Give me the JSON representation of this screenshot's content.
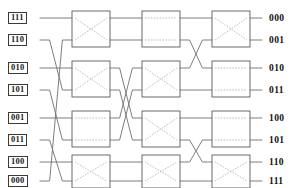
{
  "diagram": {
    "type": "benes-switching-network",
    "colors": {
      "wire": "#6f6f6f",
      "box_border": "#5a5a5a",
      "cross_line": "#a8a8a8",
      "label_text": "#111111",
      "label_border": "#3a3a3a",
      "background": "#ffffff"
    },
    "geometry": {
      "width": 307,
      "height": 188,
      "line_ys": [
        18,
        40,
        68,
        90,
        118,
        140,
        162,
        181
      ],
      "stage_x": [
        72,
        142,
        212
      ],
      "box_w": 38,
      "input_wire_x": 40,
      "output_wire_x": 262
    },
    "inputs": [
      {
        "label": "111",
        "y": 18
      },
      {
        "label": "110",
        "y": 40
      },
      {
        "label": "010",
        "y": 68
      },
      {
        "label": "101",
        "y": 90
      },
      {
        "label": "001",
        "y": 118
      },
      {
        "label": "011",
        "y": 140
      },
      {
        "label": "100",
        "y": 162
      },
      {
        "label": "000",
        "y": 181
      }
    ],
    "outputs": [
      {
        "label": "000",
        "y": 18
      },
      {
        "label": "001",
        "y": 40
      },
      {
        "label": "010",
        "y": 68
      },
      {
        "label": "011",
        "y": 90
      },
      {
        "label": "100",
        "y": 118
      },
      {
        "label": "101",
        "y": 140
      },
      {
        "label": "110",
        "y": 162
      },
      {
        "label": "111",
        "y": 181
      }
    ],
    "stages": [
      {
        "name": "stage-1",
        "x": 72,
        "switches": [
          {
            "name": "switch-1-1",
            "state": "cross"
          },
          {
            "name": "switch-1-2",
            "state": "cross"
          },
          {
            "name": "switch-1-3",
            "state": "straight"
          },
          {
            "name": "switch-1-4",
            "state": "cross"
          }
        ]
      },
      {
        "name": "stage-2",
        "x": 142,
        "switches": [
          {
            "name": "switch-2-1",
            "state": "straight"
          },
          {
            "name": "switch-2-2",
            "state": "cross"
          },
          {
            "name": "switch-2-3",
            "state": "cross"
          },
          {
            "name": "switch-2-4",
            "state": "cross"
          }
        ]
      },
      {
        "name": "stage-3",
        "x": 212,
        "switches": [
          {
            "name": "switch-3-1",
            "state": "cross"
          },
          {
            "name": "switch-3-2",
            "state": "straight"
          },
          {
            "name": "switch-3-3",
            "state": "straight"
          },
          {
            "name": "switch-3-4",
            "state": "cross"
          }
        ]
      }
    ],
    "permutations": {
      "input_to_stage1": [
        0,
        3,
        2,
        5,
        4,
        7,
        6,
        1
      ],
      "stage1_to_stage2": [
        0,
        1,
        4,
        5,
        2,
        3,
        6,
        7
      ],
      "stage2_to_stage3": [
        0,
        2,
        1,
        3,
        4,
        6,
        5,
        7
      ]
    }
  }
}
